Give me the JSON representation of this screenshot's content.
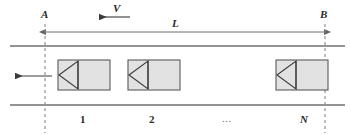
{
  "figure": {
    "labels": {
      "point_a": "A",
      "point_b": "B",
      "velocity": "V",
      "length": "L",
      "car_1": "1",
      "car_2": "2",
      "car_ellipsis": "...",
      "car_n": "N"
    },
    "colors": {
      "line": "#6f6f6f",
      "dashed": "#8a8a8a",
      "car_fill": "#e2e2e2",
      "car_stroke": "#5a5a5a",
      "text": "#2b2b2b",
      "arrow": "#3a3a3a",
      "background": "#ffffff"
    },
    "geometry": {
      "rail_top_y": 46,
      "rail_bottom_y": 105,
      "rail_x_start": 10,
      "rail_x_end": 345,
      "dashed_a_x": 45,
      "dashed_b_x": 325,
      "dimension_line_y": 32,
      "car_top_y": 60,
      "car_bottom_y": 90,
      "cars": [
        {
          "name": "car-1",
          "x": 58,
          "width": 52
        },
        {
          "name": "car-2",
          "x": 128,
          "width": 52
        },
        {
          "name": "car-n",
          "x": 276,
          "width": 52
        }
      ]
    },
    "annotations": {
      "velocity_arrow_direction": "left",
      "motion_arrow_direction": "left",
      "dimension_arrow_direction": "both"
    }
  }
}
